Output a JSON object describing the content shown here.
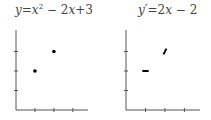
{
  "chart_data": [
    {
      "type": "scatter",
      "title": "y=x² − 2x+3",
      "title_parts": {
        "var": "y",
        "eq": "=",
        "x1": "x",
        "sup": "2",
        "rest1": " − 2",
        "x2": "x",
        "rest2": "+3"
      },
      "xlabel": "",
      "ylabel": "",
      "xlim": [
        0,
        3.8
      ],
      "ylim": [
        0,
        4.1
      ],
      "xticks": [
        1,
        2,
        3
      ],
      "yticks": [
        1,
        2,
        3
      ],
      "points": [
        {
          "x": 1,
          "y": 2
        },
        {
          "x": 2,
          "y": 3
        }
      ],
      "marker": "dot",
      "color": "#000000"
    },
    {
      "type": "scatter",
      "title": "y′=2x − 2",
      "title_parts": {
        "var": "y′",
        "eq": "=2",
        "x1": "x",
        "rest1": " − 2"
      },
      "xlabel": "",
      "ylabel": "",
      "xlim": [
        0,
        3.8
      ],
      "ylim": [
        0,
        4.1
      ],
      "xticks": [
        1,
        2,
        3
      ],
      "yticks": [
        1,
        2,
        3
      ],
      "points": [
        {
          "x": 1,
          "y": 2,
          "slope": 0
        },
        {
          "x": 2,
          "y": 3,
          "slope": 2
        }
      ],
      "marker": "slope-segment",
      "color": "#000000"
    }
  ]
}
